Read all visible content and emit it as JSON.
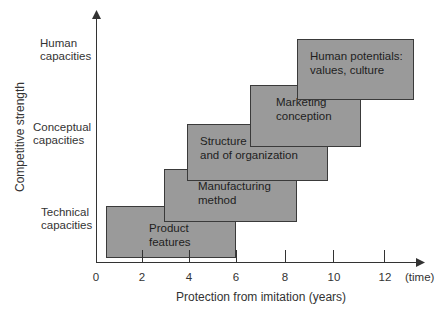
{
  "y_axis": {
    "title": "Competitive strength",
    "levels": [
      {
        "line1": "Human",
        "line2": "capacities"
      },
      {
        "line1": "Conceptual",
        "line2": "capacities"
      },
      {
        "line1": "Technical",
        "line2": "capacities"
      }
    ]
  },
  "x_axis": {
    "title": "Protection from imitation (years)",
    "ticks": [
      "0",
      "2",
      "4",
      "6",
      "8",
      "10",
      "12"
    ],
    "end_label": "(time)"
  },
  "boxes": [
    {
      "line1": "Product",
      "line2": "features",
      "x_start": 0.5,
      "x_end": 6
    },
    {
      "line1": "Manufacturing",
      "line2": "method",
      "x_start": 3,
      "x_end": 8.5
    },
    {
      "line1": "Structure of work flow",
      "line2": "and of organization",
      "x_start": 4,
      "x_end": 9.8
    },
    {
      "line1": "Marketing",
      "line2": "conception",
      "x_start": 6.6,
      "x_end": 11.1
    },
    {
      "line1": "Human potentials:",
      "line2": "values, culture",
      "x_start": 8.6,
      "x_end": 13.4
    }
  ],
  "colors": {
    "box_fill": "#9a9a9a",
    "box_border": "#3a3a3a",
    "axis": "#333333"
  }
}
